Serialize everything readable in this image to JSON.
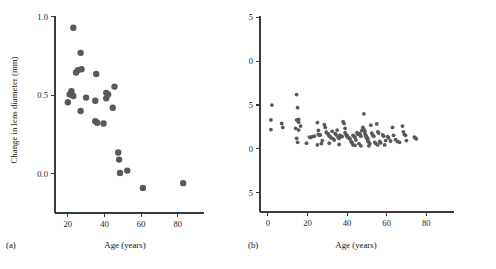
{
  "figure": {
    "panels": [
      {
        "tag": "(a)",
        "xlabel": "Age (years)",
        "ylabel": "Change in lens diameter (mm)"
      },
      {
        "tag": "(b)",
        "xlabel": "Age (years)",
        "ylabel": "Change in lens diameter (mm)"
      }
    ],
    "marker_color": "#595959"
  },
  "chart_data": [
    {
      "type": "scatter",
      "panel": "(a)",
      "title": "",
      "xlabel": "Age (years)",
      "ylabel": "Change in lens diameter (mm)",
      "xlim": [
        13,
        90
      ],
      "ylim": [
        -0.25,
        1.03
      ],
      "xticks": [
        20,
        40,
        60,
        80
      ],
      "yticks": [
        0.0,
        0.5,
        1.0
      ],
      "ytick_labels": [
        "0.0",
        "0.5",
        "1.0"
      ],
      "xtick_labels": [
        "20",
        "40",
        "60",
        "80"
      ],
      "grid": false,
      "legend": null,
      "marker_size": 3.2,
      "marker_color": "#595959",
      "points": [
        {
          "x": 23.0,
          "y": 0.93
        },
        {
          "x": 27.0,
          "y": 0.77
        },
        {
          "x": 25.5,
          "y": 0.66
        },
        {
          "x": 27.5,
          "y": 0.665
        },
        {
          "x": 24.5,
          "y": 0.645
        },
        {
          "x": 35.5,
          "y": 0.635
        },
        {
          "x": 45.5,
          "y": 0.555
        },
        {
          "x": 22.0,
          "y": 0.525
        },
        {
          "x": 21.0,
          "y": 0.505
        },
        {
          "x": 23.0,
          "y": 0.495
        },
        {
          "x": 41.0,
          "y": 0.515
        },
        {
          "x": 42.0,
          "y": 0.505
        },
        {
          "x": 41.0,
          "y": 0.48
        },
        {
          "x": 30.0,
          "y": 0.485
        },
        {
          "x": 20.0,
          "y": 0.455
        },
        {
          "x": 35.0,
          "y": 0.465
        },
        {
          "x": 44.5,
          "y": 0.42
        },
        {
          "x": 27.0,
          "y": 0.4
        },
        {
          "x": 35.0,
          "y": 0.335
        },
        {
          "x": 36.0,
          "y": 0.325
        },
        {
          "x": 39.5,
          "y": 0.32
        },
        {
          "x": 47.5,
          "y": 0.135
        },
        {
          "x": 48.0,
          "y": 0.09
        },
        {
          "x": 48.5,
          "y": 0.005
        },
        {
          "x": 52.5,
          "y": 0.02
        },
        {
          "x": 61.0,
          "y": -0.09
        },
        {
          "x": 83.0,
          "y": -0.06
        }
      ]
    },
    {
      "type": "scatter",
      "panel": "(b)",
      "title": "",
      "xlabel": "Age (years)",
      "ylabel": "Change in lens diameter (mm)",
      "xlim": [
        -4,
        90
      ],
      "ylim": [
        -0.72,
        1.55
      ],
      "xticks": [
        0,
        20,
        40,
        60,
        80
      ],
      "yticks": [
        -0.5,
        0.0,
        0.5,
        1.0,
        1.5
      ],
      "ytick_labels": [
        "−0.5",
        "0.0",
        "0.5",
        "1.0",
        "1.5"
      ],
      "xtick_labels": [
        "0",
        "20",
        "40",
        "60",
        "80"
      ],
      "grid": false,
      "legend": null,
      "marker_size": 1.9,
      "marker_color": "#595959",
      "points": [
        {
          "x": 14.5,
          "y": 0.62
        },
        {
          "x": 2.0,
          "y": 0.5
        },
        {
          "x": 15.0,
          "y": 0.47
        },
        {
          "x": 1.5,
          "y": 0.33
        },
        {
          "x": 1.5,
          "y": 0.22
        },
        {
          "x": 7.0,
          "y": 0.29
        },
        {
          "x": 7.5,
          "y": 0.245
        },
        {
          "x": 14.5,
          "y": 0.33
        },
        {
          "x": 15.5,
          "y": 0.335
        },
        {
          "x": 15.5,
          "y": 0.305
        },
        {
          "x": 16.5,
          "y": 0.26
        },
        {
          "x": 14.0,
          "y": 0.235
        },
        {
          "x": 15.5,
          "y": 0.215
        },
        {
          "x": 14.5,
          "y": 0.12
        },
        {
          "x": 15.0,
          "y": 0.075
        },
        {
          "x": 21.0,
          "y": 0.135
        },
        {
          "x": 21.5,
          "y": 0.13
        },
        {
          "x": 22.5,
          "y": 0.14
        },
        {
          "x": 23.5,
          "y": 0.145
        },
        {
          "x": 25.0,
          "y": 0.3
        },
        {
          "x": 25.5,
          "y": 0.21
        },
        {
          "x": 25.5,
          "y": 0.165
        },
        {
          "x": 26.0,
          "y": 0.155
        },
        {
          "x": 26.5,
          "y": 0.16
        },
        {
          "x": 27.0,
          "y": 0.06
        },
        {
          "x": 28.5,
          "y": 0.275
        },
        {
          "x": 29.0,
          "y": 0.245
        },
        {
          "x": 29.5,
          "y": 0.19
        },
        {
          "x": 30.0,
          "y": 0.175
        },
        {
          "x": 30.5,
          "y": 0.17
        },
        {
          "x": 31.0,
          "y": 0.145
        },
        {
          "x": 31.5,
          "y": 0.14
        },
        {
          "x": 32.0,
          "y": 0.125
        },
        {
          "x": 32.5,
          "y": 0.2
        },
        {
          "x": 33.0,
          "y": 0.115
        },
        {
          "x": 33.5,
          "y": 0.1
        },
        {
          "x": 34.0,
          "y": 0.175
        },
        {
          "x": 34.5,
          "y": 0.16
        },
        {
          "x": 35.0,
          "y": 0.215
        },
        {
          "x": 35.5,
          "y": 0.13
        },
        {
          "x": 36.0,
          "y": 0.12
        },
        {
          "x": 36.5,
          "y": 0.155
        },
        {
          "x": 37.0,
          "y": 0.145
        },
        {
          "x": 37.5,
          "y": 0.14
        },
        {
          "x": 38.0,
          "y": 0.31
        },
        {
          "x": 38.5,
          "y": 0.29
        },
        {
          "x": 39.0,
          "y": 0.235
        },
        {
          "x": 39.0,
          "y": 0.185
        },
        {
          "x": 39.5,
          "y": 0.16
        },
        {
          "x": 40.0,
          "y": 0.155
        },
        {
          "x": 40.0,
          "y": 0.14
        },
        {
          "x": 40.5,
          "y": 0.135
        },
        {
          "x": 41.0,
          "y": 0.125
        },
        {
          "x": 41.0,
          "y": 0.12
        },
        {
          "x": 41.5,
          "y": 0.115
        },
        {
          "x": 42.0,
          "y": 0.085
        },
        {
          "x": 42.5,
          "y": 0.07
        },
        {
          "x": 43.0,
          "y": 0.155
        },
        {
          "x": 43.5,
          "y": 0.145
        },
        {
          "x": 44.0,
          "y": 0.13
        },
        {
          "x": 44.5,
          "y": 0.1
        },
        {
          "x": 45.0,
          "y": 0.185
        },
        {
          "x": 45.5,
          "y": 0.165
        },
        {
          "x": 46.0,
          "y": 0.06
        },
        {
          "x": 46.5,
          "y": 0.175
        },
        {
          "x": 47.0,
          "y": 0.145
        },
        {
          "x": 47.5,
          "y": 0.21
        },
        {
          "x": 48.0,
          "y": 0.245
        },
        {
          "x": 48.5,
          "y": 0.225
        },
        {
          "x": 49.0,
          "y": 0.2
        },
        {
          "x": 49.0,
          "y": 0.175
        },
        {
          "x": 49.5,
          "y": 0.155
        },
        {
          "x": 49.5,
          "y": 0.14
        },
        {
          "x": 50.0,
          "y": 0.135
        },
        {
          "x": 50.0,
          "y": 0.12
        },
        {
          "x": 50.5,
          "y": 0.115
        },
        {
          "x": 50.5,
          "y": 0.09
        },
        {
          "x": 51.0,
          "y": 0.075
        },
        {
          "x": 51.5,
          "y": 0.06
        },
        {
          "x": 48.5,
          "y": 0.4
        },
        {
          "x": 52.0,
          "y": 0.27
        },
        {
          "x": 52.5,
          "y": 0.18
        },
        {
          "x": 53.0,
          "y": 0.155
        },
        {
          "x": 53.5,
          "y": 0.145
        },
        {
          "x": 54.0,
          "y": 0.075
        },
        {
          "x": 54.5,
          "y": 0.06
        },
        {
          "x": 55.0,
          "y": 0.285
        },
        {
          "x": 55.5,
          "y": 0.195
        },
        {
          "x": 56.0,
          "y": 0.18
        },
        {
          "x": 56.5,
          "y": 0.085
        },
        {
          "x": 57.0,
          "y": 0.07
        },
        {
          "x": 58.0,
          "y": 0.16
        },
        {
          "x": 58.5,
          "y": 0.145
        },
        {
          "x": 59.5,
          "y": 0.095
        },
        {
          "x": 60.5,
          "y": 0.14
        },
        {
          "x": 61.0,
          "y": 0.125
        },
        {
          "x": 62.0,
          "y": 0.09
        },
        {
          "x": 63.0,
          "y": 0.245
        },
        {
          "x": 63.5,
          "y": 0.155
        },
        {
          "x": 64.5,
          "y": 0.105
        },
        {
          "x": 65.5,
          "y": 0.085
        },
        {
          "x": 66.5,
          "y": 0.075
        },
        {
          "x": 68.0,
          "y": 0.26
        },
        {
          "x": 68.5,
          "y": 0.195
        },
        {
          "x": 69.0,
          "y": 0.165
        },
        {
          "x": 69.5,
          "y": 0.155
        },
        {
          "x": 70.0,
          "y": 0.095
        },
        {
          "x": 74.0,
          "y": 0.135
        },
        {
          "x": 74.5,
          "y": 0.125
        },
        {
          "x": 75.0,
          "y": 0.115
        },
        {
          "x": 36.0,
          "y": 0.05
        },
        {
          "x": 19.5,
          "y": 0.065
        },
        {
          "x": 25.0,
          "y": 0.045
        },
        {
          "x": 43.0,
          "y": 0.045
        },
        {
          "x": 44.0,
          "y": 0.04
        },
        {
          "x": 47.0,
          "y": 0.035
        },
        {
          "x": 51.0,
          "y": 0.035
        },
        {
          "x": 55.5,
          "y": 0.045
        },
        {
          "x": 59.0,
          "y": 0.045
        },
        {
          "x": 31.0,
          "y": 0.065
        },
        {
          "x": 27.5,
          "y": 0.095
        }
      ]
    }
  ]
}
